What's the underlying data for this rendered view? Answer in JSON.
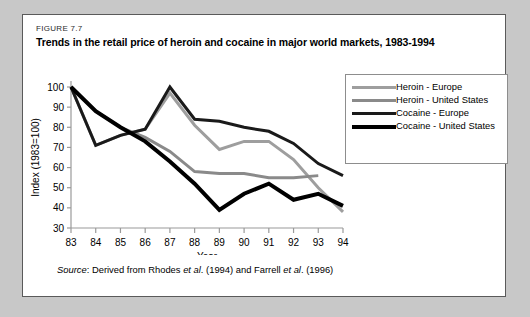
{
  "figure": {
    "number": "FIGURE 7.7",
    "title": "Trends in the retail price of heroin and cocaine in major world markets, 1983-1994",
    "source_prefix": "Source",
    "source_text": ": Derived from Rhodes ",
    "source_italic_1": "et al",
    "source_mid": ". (1994) and Farrell ",
    "source_italic_2": "et al",
    "source_end": ". (1996)"
  },
  "legend": {
    "position": "right-inside",
    "items": [
      {
        "label": "Heroin - Europe",
        "color": "#9e9e9e",
        "width": 3
      },
      {
        "label": "Heroin - United States",
        "color": "#8a8a8a",
        "width": 3
      },
      {
        "label": "Cocaine - Europe",
        "color": "#1a1a1a",
        "width": 3
      },
      {
        "label": "Cocaine - United States",
        "color": "#000000",
        "width": 4
      }
    ]
  },
  "chart_data": {
    "type": "line",
    "title": "Trends in the retail price of heroin and cocaine in major world markets, 1983-1994",
    "xlabel": "Year",
    "ylabel": "Index (1983=100)",
    "x": [
      83,
      84,
      85,
      86,
      87,
      88,
      89,
      90,
      91,
      92,
      93,
      94
    ],
    "xlim": [
      83,
      94
    ],
    "ylim": [
      30,
      100
    ],
    "yticks": [
      30,
      40,
      50,
      60,
      70,
      80,
      90,
      100
    ],
    "ytick_labels": [
      "30",
      "40",
      "50",
      "60",
      "70",
      "80",
      "90",
      "100"
    ],
    "xtick_labels": [
      "83",
      "84",
      "85",
      "86",
      "87",
      "88",
      "89",
      "90",
      "91",
      "92",
      "93",
      "94"
    ],
    "grid": false,
    "series": [
      {
        "name": "Heroin - Europe",
        "color": "#9e9e9e",
        "width": 3,
        "values": [
          100,
          71,
          76,
          79,
          97,
          81,
          69,
          73,
          73,
          64,
          50,
          38
        ]
      },
      {
        "name": "Heroin - United States",
        "color": "#8a8a8a",
        "width": 3,
        "values": [
          100,
          88,
          80,
          75,
          68,
          58,
          57,
          57,
          55,
          55,
          56,
          null
        ]
      },
      {
        "name": "Cocaine - Europe",
        "color": "#1a1a1a",
        "width": 3,
        "values": [
          100,
          71,
          76,
          79,
          100,
          84,
          83,
          80,
          78,
          72,
          62,
          56
        ]
      },
      {
        "name": "Cocaine - United States",
        "color": "#000000",
        "width": 4,
        "values": [
          100,
          88,
          80,
          73,
          63,
          52,
          39,
          47,
          52,
          44,
          47,
          41
        ]
      }
    ]
  }
}
